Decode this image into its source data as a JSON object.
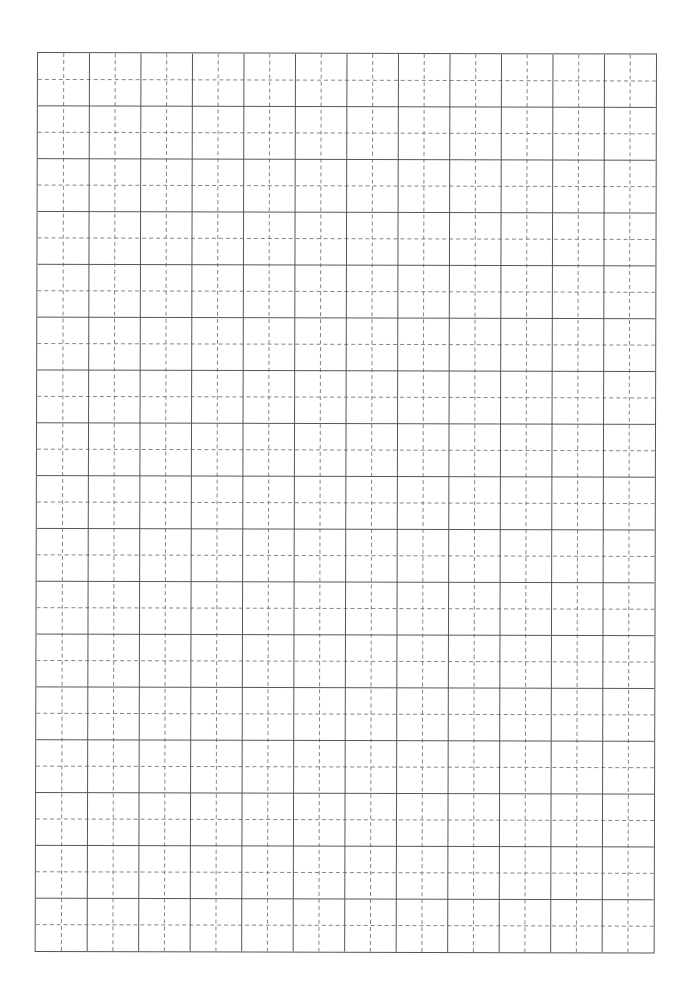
{
  "document": {
    "type": "grid-paper",
    "grid": {
      "columns": 12,
      "rows": 17,
      "subdivision": "dashed-center-lines",
      "solid_line_color": "#555555",
      "dashed_line_color": "#777777",
      "background": "#ffffff"
    }
  }
}
